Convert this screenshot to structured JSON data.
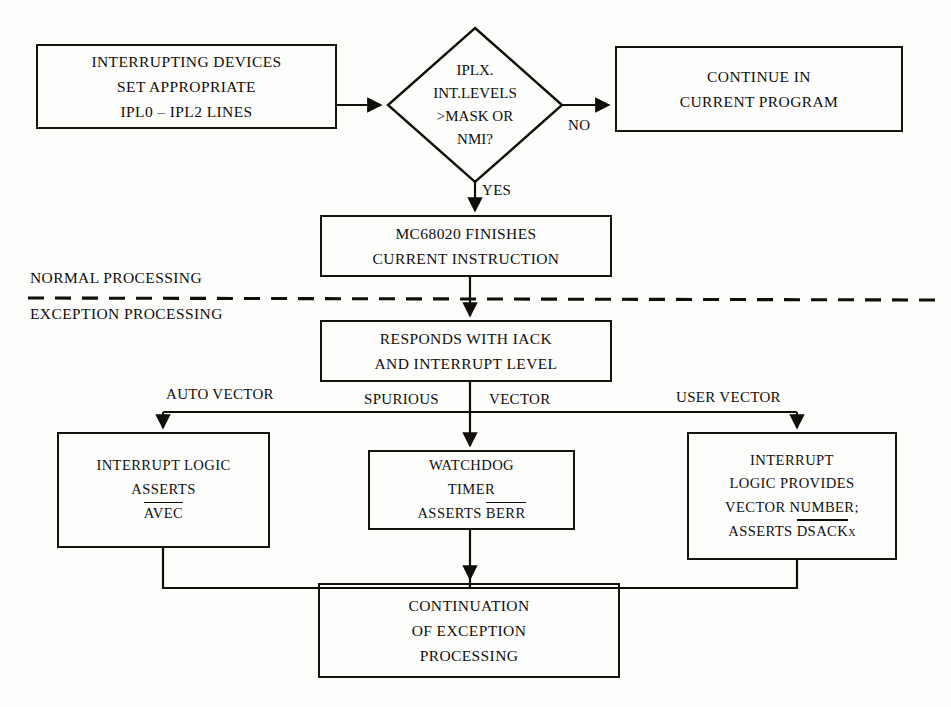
{
  "diagram": {
    "ink_color": "#100d0a",
    "background_color": "#fdfdfc"
  },
  "nodes": {
    "interrupting_devices": {
      "shape": "rectangle",
      "lines": [
        "INTERRUPTING DEVICES",
        "SET APPROPRIATE",
        "IPL0 – IPL2 LINES"
      ]
    },
    "decision": {
      "shape": "diamond",
      "lines": [
        "IPLX.",
        "INT.LEVELS",
        ">MASK OR",
        "NMI?"
      ]
    },
    "continue_program": {
      "shape": "rectangle",
      "lines": [
        "CONTINUE IN",
        "CURRENT PROGRAM"
      ]
    },
    "finishes_instruction": {
      "shape": "rectangle",
      "lines": [
        "MC68020 FINISHES",
        "CURRENT INSTRUCTION"
      ]
    },
    "responds_iack": {
      "shape": "rectangle",
      "lines": [
        "RESPONDS WITH IACK",
        "AND INTERRUPT LEVEL"
      ]
    },
    "auto_vector_box": {
      "shape": "rectangle",
      "lines": [
        "INTERRUPT LOGIC",
        "ASSERTS"
      ],
      "overlined": "AVEC"
    },
    "watchdog_box": {
      "shape": "rectangle",
      "lines": [
        "WATCHDOG",
        "TIMER"
      ],
      "asserts_prefix": "ASSERTS ",
      "overlined": "BERR"
    },
    "user_vector_box": {
      "shape": "rectangle",
      "lines": [
        "INTERRUPT",
        "LOGIC PROVIDES",
        "VECTOR NUMBER;"
      ],
      "asserts_prefix": "ASSERTS ",
      "overlined": "DSACK",
      "overlined_suffix": "x"
    },
    "continuation_box": {
      "shape": "rectangle",
      "lines": [
        "CONTINUATION",
        "OF EXCEPTION",
        "PROCESSING"
      ]
    }
  },
  "edge_labels": {
    "no": "NO",
    "yes": "YES",
    "auto_vector": "AUTO VECTOR",
    "spurious": "SPURIOUS",
    "vector": "VECTOR",
    "user_vector": "USER VECTOR"
  },
  "zone_labels": {
    "normal": "NORMAL PROCESSING",
    "exception": "EXCEPTION PROCESSING"
  }
}
